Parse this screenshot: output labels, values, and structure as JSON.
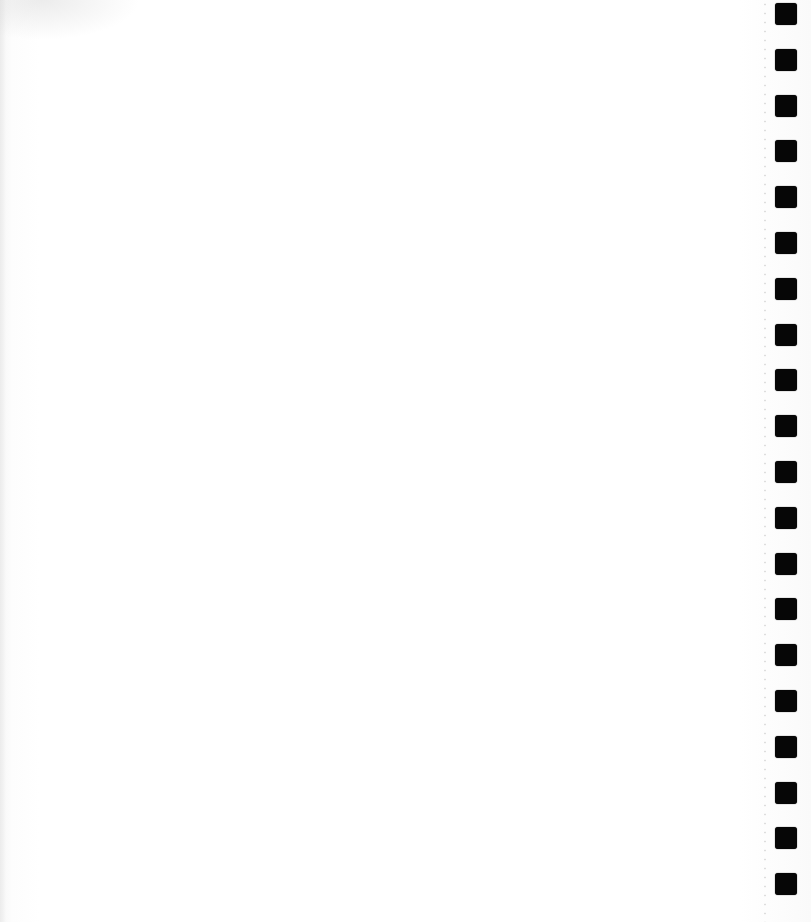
{
  "page": {
    "type": "blank notebook sheet",
    "background_color": "#ffffff",
    "hole_color": "#060606",
    "punch_holes": {
      "count": 20,
      "x": 775,
      "size": 22,
      "first_top": 3,
      "spacing": 45.8
    }
  }
}
